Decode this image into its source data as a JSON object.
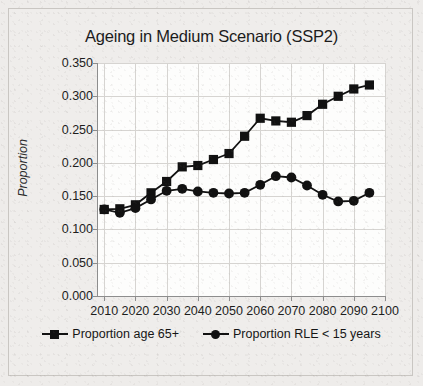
{
  "figure": {
    "title": "Ageing in Medium Scenario (SSP2)",
    "ylabel": "Proportion"
  },
  "legend": {
    "entries": [
      {
        "label": "Proportion age 65+",
        "marker": "square-marker-icon"
      },
      {
        "label": "Proportion RLE < 15 years",
        "marker": "circle-marker-icon"
      }
    ]
  },
  "chart_data": {
    "type": "line",
    "title": "Ageing in Medium Scenario (SSP2)",
    "xlabel": "",
    "ylabel": "Proportion",
    "xlim": [
      2008,
      2100
    ],
    "ylim": [
      0.0,
      0.35
    ],
    "ytick_labels": [
      "0.000",
      "0.050",
      "0.100",
      "0.150",
      "0.200",
      "0.250",
      "0.300",
      "0.350"
    ],
    "ytick_values": [
      0.0,
      0.05,
      0.1,
      0.15,
      0.2,
      0.25,
      0.3,
      0.35
    ],
    "xtick_labels": [
      "2010",
      "2020",
      "2030",
      "2040",
      "2050",
      "2060",
      "2070",
      "2080",
      "2090",
      "2100"
    ],
    "xtick_values": [
      2010,
      2020,
      2030,
      2040,
      2050,
      2060,
      2070,
      2080,
      2090,
      2100
    ],
    "grid": true,
    "legend_position": "bottom",
    "x": [
      2010,
      2015,
      2020,
      2025,
      2030,
      2035,
      2040,
      2045,
      2050,
      2055,
      2060,
      2065,
      2070,
      2075,
      2080,
      2085,
      2090,
      2095
    ],
    "series": [
      {
        "name": "Proportion age 65+",
        "marker": "square",
        "values": [
          0.13,
          0.131,
          0.137,
          0.155,
          0.172,
          0.194,
          0.196,
          0.205,
          0.214,
          0.24,
          0.267,
          0.263,
          0.261,
          0.271,
          0.288,
          0.3,
          0.311,
          0.317
        ]
      },
      {
        "name": "Proportion RLE < 15 years",
        "marker": "circle",
        "values": [
          0.13,
          0.125,
          0.132,
          0.145,
          0.158,
          0.161,
          0.157,
          0.155,
          0.154,
          0.155,
          0.167,
          0.18,
          0.178,
          0.166,
          0.152,
          0.142,
          0.143,
          0.155
        ]
      }
    ]
  }
}
